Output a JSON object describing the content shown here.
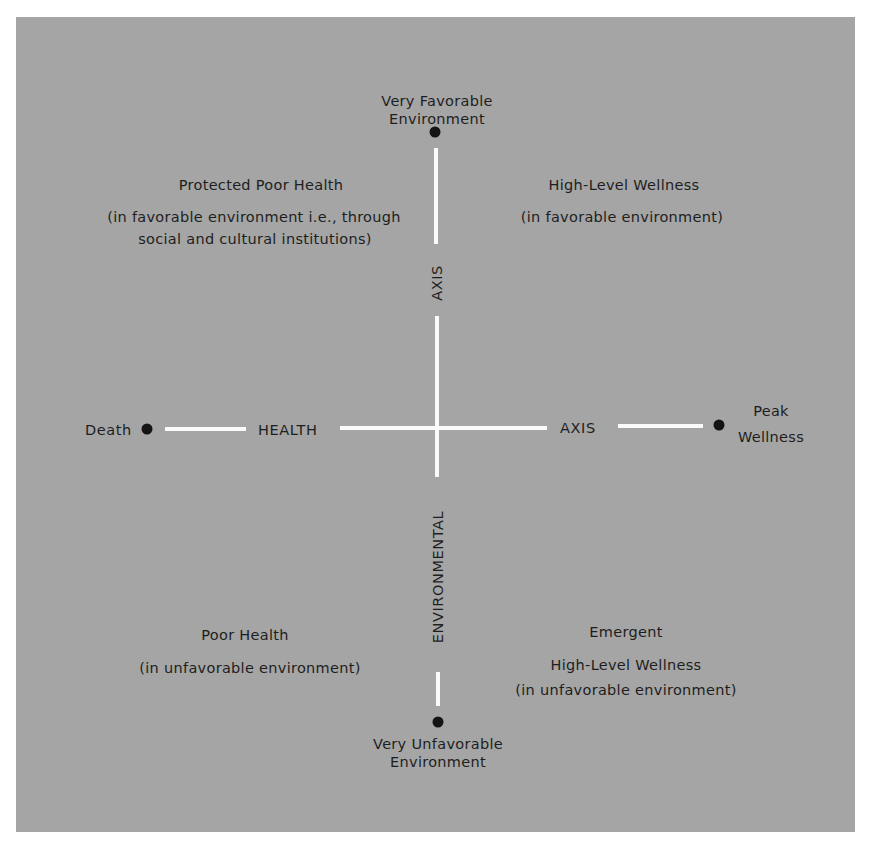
{
  "diagram": {
    "colors": {
      "background": "#a5a5a5",
      "axis_line": "#fafafa",
      "text": "#1e1e1e",
      "dot": "#141414"
    },
    "vertical_axis": {
      "top_endpoint": [
        "Very Favorable",
        "Environment"
      ],
      "bottom_endpoint": [
        "Very Unfavorable",
        "Environment"
      ],
      "label_upper": "AXIS",
      "label_lower": "ENVIRONMENTAL"
    },
    "horizontal_axis": {
      "left_endpoint": "Death",
      "right_endpoint": [
        "Peak",
        "Wellness"
      ],
      "label_left": "HEALTH",
      "label_right": "AXIS"
    },
    "quadrants": {
      "top_left": {
        "title": "Protected Poor Health",
        "lines": [
          "(in favorable environment i.e., through",
          "social and cultural institutions)"
        ]
      },
      "top_right": {
        "title": "High-Level Wellness",
        "lines": [
          "(in favorable environment)"
        ]
      },
      "bottom_left": {
        "title": "Poor Health",
        "lines": [
          "(in unfavorable environment)"
        ]
      },
      "bottom_right": {
        "title": "Emergent",
        "lines": [
          "High-Level Wellness",
          "(in unfavorable environment)"
        ]
      }
    }
  }
}
